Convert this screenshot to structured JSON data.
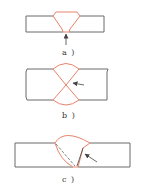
{
  "figures": [
    {
      "id": "a",
      "label": "a )",
      "description": "Single-V groove butt weld, arrow pointing at weld root from below"
    },
    {
      "id": "b",
      "label": "b )",
      "description": "Double-V (X) groove butt weld, arrow pointing at center crossing"
    },
    {
      "id": "c",
      "label": "c )",
      "description": "Single-bevel weld with dashed fusion line, arrow pointing at bevel side"
    }
  ],
  "colors": {
    "plate_outline": "#6b6b6b",
    "weld_outline": "#e8826a",
    "arrow": "#555555",
    "dashed_line": "#5a6a6a",
    "background": "#ffffff"
  }
}
